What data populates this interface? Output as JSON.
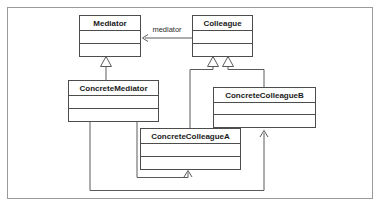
{
  "diagram": {
    "kind": "uml-class-diagram",
    "pattern_name": "Mediator",
    "background_color": "#ffffff",
    "frame": {
      "x": 7,
      "y": 7,
      "width": 366,
      "height": 192,
      "stroke": "#9a9a9a"
    },
    "box_stroke": "#4d4d4d",
    "line_stroke": "#5a5a5a",
    "box_fill": "#ffffff",
    "classes": [
      {
        "id": "mediator",
        "name": "Mediator",
        "x": 79,
        "y": 15,
        "width": 62,
        "height": 42,
        "title_height": 15,
        "attr_height": 13,
        "stereotype": "abstract"
      },
      {
        "id": "colleague",
        "name": "Colleague",
        "x": 192,
        "y": 15,
        "width": 61,
        "height": 42,
        "title_height": 15,
        "attr_height": 13,
        "stereotype": "abstract"
      },
      {
        "id": "concrete-mediator",
        "name": "ConcreteMediator",
        "x": 68,
        "y": 80,
        "width": 91,
        "height": 42,
        "title_height": 15,
        "attr_height": 13,
        "stereotype": "concrete"
      },
      {
        "id": "concrete-colleague-b",
        "name": "ConcreteColleagueB",
        "x": 213,
        "y": 87,
        "width": 103,
        "height": 41,
        "title_height": 15,
        "attr_height": 13,
        "stereotype": "concrete"
      },
      {
        "id": "concrete-colleague-a",
        "name": "ConcreteColleagueA",
        "x": 140,
        "y": 128,
        "width": 101,
        "height": 42,
        "title_height": 15,
        "attr_height": 13,
        "stereotype": "concrete"
      }
    ],
    "relationships": [
      {
        "id": "colleague-to-mediator",
        "type": "association",
        "from": "colleague",
        "to": "mediator",
        "label": "mediator",
        "label_x": 167,
        "label_y": 31,
        "arrow": "open",
        "path": "M 192 38 L 145 38",
        "arrow_tip_x": 142,
        "arrow_tip_y": 38
      },
      {
        "id": "concrete-mediator-generalizes-mediator",
        "type": "generalization",
        "from": "concrete-mediator",
        "to": "mediator",
        "path": "M 106 80 L 106 66",
        "triangle": "106,56 101,66 111,66"
      },
      {
        "id": "concrete-colleague-a-generalizes-colleague",
        "type": "generalization",
        "from": "concrete-colleague-a",
        "to": "colleague",
        "path": "M 190 128 L 190 70 L 213 70 L 213 66",
        "triangle": "213,56 208,66 218,66"
      },
      {
        "id": "concrete-colleague-b-generalizes-colleague",
        "type": "generalization",
        "from": "concrete-colleague-b",
        "to": "colleague",
        "path": "M 264 87 L 264 70 L 228 70 L 228 66",
        "triangle": "228,56 223,66 233,66"
      },
      {
        "id": "concrete-mediator-to-concrete-colleague-a",
        "type": "association",
        "from": "concrete-mediator",
        "to": "concrete-colleague-a",
        "arrow": "open",
        "path": "M 137 122 L 137 178 L 188 178 L 188 173",
        "arrow_tip_x": 188,
        "arrow_tip_y": 170
      },
      {
        "id": "concrete-mediator-to-concrete-colleague-b",
        "type": "association",
        "from": "concrete-mediator",
        "to": "concrete-colleague-b",
        "arrow": "open",
        "path": "M 90 122 L 90 191 L 264 191 L 264 133",
        "arrow_tip_x": 264,
        "arrow_tip_y": 130
      }
    ]
  }
}
